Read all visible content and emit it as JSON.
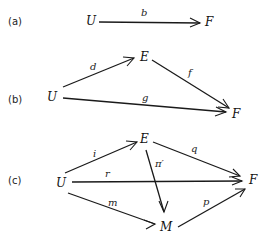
{
  "diagrams": [
    {
      "label": "(a)",
      "nodes": {
        "U": "U",
        "F": "F"
      },
      "edges": [
        {
          "from": "U",
          "to": "F",
          "label": "b"
        }
      ]
    },
    {
      "label": "(b)",
      "nodes": {
        "U": "U",
        "E": "E",
        "F": "F"
      },
      "edges": [
        {
          "from": "U",
          "to": "E",
          "label": "d"
        },
        {
          "from": "E",
          "to": "F",
          "label": "f"
        },
        {
          "from": "U",
          "to": "F",
          "label": "g"
        }
      ]
    },
    {
      "label": "(c)",
      "nodes": {
        "U": "U",
        "E": "E",
        "F": "F",
        "M": "M"
      },
      "edges": [
        {
          "from": "U",
          "to": "E",
          "label": "i"
        },
        {
          "from": "E",
          "to": "F",
          "label": "q"
        },
        {
          "from": "U",
          "to": "F",
          "label": "r"
        },
        {
          "from": "E",
          "to": "M",
          "label": "π′"
        },
        {
          "from": "U",
          "to": "M",
          "label": "m"
        },
        {
          "from": "M",
          "to": "F",
          "label": "p"
        }
      ]
    }
  ]
}
